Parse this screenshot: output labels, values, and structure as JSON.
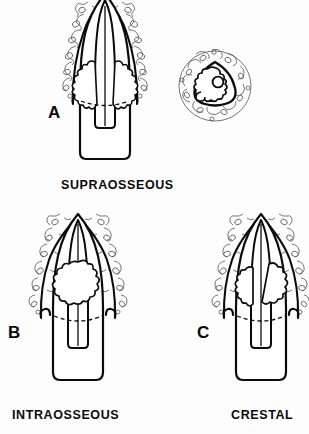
{
  "figure": {
    "background_color": "#fdfdfd",
    "ink_color": "#0b0b0b",
    "bone_stipple_color": "#6d6d6d",
    "panels": [
      {
        "letter": "A",
        "caption": "SUPRAOSSEOUS",
        "description": "Longitudinal section of tooth root apex with lesion extending above the alveolar bone crest",
        "has_cross_section_inset": true
      },
      {
        "letter": "B",
        "caption": "INTRAOSSEOUS",
        "description": "Longitudinal section of tooth root apex with lesion contained within the alveolar bone",
        "has_cross_section_inset": false
      },
      {
        "letter": "C",
        "caption": "CRESTAL",
        "description": "Longitudinal section of tooth root apex with lesion at the alveolar bone crest",
        "has_cross_section_inset": false
      }
    ],
    "inset": {
      "name": "root-cross-section",
      "description": "Transverse cross-section of root surrounded by trabecular bone showing pulp canal"
    }
  }
}
